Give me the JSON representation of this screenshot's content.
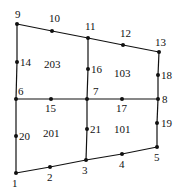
{
  "diagram": {
    "type": "finite-element-mesh",
    "colors": {
      "line": "#111111",
      "background": "#ffffff"
    },
    "nodes": [
      {
        "id": "1",
        "label": "1",
        "x": 16,
        "y": 173,
        "lx": 12,
        "ly": 187
      },
      {
        "id": "2",
        "label": "2",
        "x": 50,
        "y": 167,
        "lx": 47,
        "ly": 181
      },
      {
        "id": "3",
        "label": "3",
        "x": 86,
        "y": 160,
        "lx": 82,
        "ly": 174
      },
      {
        "id": "4",
        "label": "4",
        "x": 122,
        "y": 154,
        "lx": 119,
        "ly": 168
      },
      {
        "id": "5",
        "label": "5",
        "x": 157,
        "y": 147,
        "lx": 154,
        "ly": 161
      },
      {
        "id": "6",
        "label": "6",
        "x": 16,
        "y": 99,
        "lx": 18,
        "ly": 95
      },
      {
        "id": "7",
        "label": "7",
        "x": 87,
        "y": 99,
        "lx": 93,
        "ly": 95
      },
      {
        "id": "8",
        "label": "8",
        "x": 158,
        "y": 99,
        "lx": 162,
        "ly": 103
      },
      {
        "id": "9",
        "label": "9",
        "x": 17,
        "y": 24,
        "lx": 15,
        "ly": 18
      },
      {
        "id": "10",
        "label": "10",
        "x": 52,
        "y": 31,
        "lx": 49,
        "ly": 22
      },
      {
        "id": "11",
        "label": "11",
        "x": 88,
        "y": 38,
        "lx": 85,
        "ly": 30
      },
      {
        "id": "12",
        "label": "12",
        "x": 123,
        "y": 45,
        "lx": 120,
        "ly": 37
      },
      {
        "id": "13",
        "label": "13",
        "x": 159,
        "y": 52,
        "lx": 155,
        "ly": 46
      },
      {
        "id": "14",
        "label": "14",
        "x": 17,
        "y": 62,
        "lx": 20,
        "ly": 66
      },
      {
        "id": "15",
        "label": "15",
        "x": 51,
        "y": 99,
        "lx": 45,
        "ly": 112
      },
      {
        "id": "16",
        "label": "16",
        "x": 88,
        "y": 69,
        "lx": 91,
        "ly": 73
      },
      {
        "id": "17",
        "label": "17",
        "x": 122,
        "y": 99,
        "lx": 116,
        "ly": 112
      },
      {
        "id": "18",
        "label": "18",
        "x": 158,
        "y": 75,
        "lx": 161,
        "ly": 79
      },
      {
        "id": "19",
        "label": "19",
        "x": 157,
        "y": 123,
        "lx": 161,
        "ly": 127
      },
      {
        "id": "20",
        "label": "20",
        "x": 16,
        "y": 136,
        "lx": 19,
        "ly": 140
      },
      {
        "id": "21",
        "label": "21",
        "x": 87,
        "y": 129,
        "lx": 90,
        "ly": 133
      }
    ],
    "edges": [
      [
        "1",
        "2"
      ],
      [
        "2",
        "3"
      ],
      [
        "3",
        "4"
      ],
      [
        "4",
        "5"
      ],
      [
        "6",
        "15"
      ],
      [
        "15",
        "7"
      ],
      [
        "7",
        "17"
      ],
      [
        "17",
        "8"
      ],
      [
        "9",
        "10"
      ],
      [
        "10",
        "11"
      ],
      [
        "11",
        "12"
      ],
      [
        "12",
        "13"
      ],
      [
        "1",
        "20"
      ],
      [
        "20",
        "6"
      ],
      [
        "6",
        "14"
      ],
      [
        "14",
        "9"
      ],
      [
        "3",
        "21"
      ],
      [
        "21",
        "7"
      ],
      [
        "7",
        "16"
      ],
      [
        "16",
        "11"
      ],
      [
        "5",
        "19"
      ],
      [
        "19",
        "8"
      ],
      [
        "8",
        "18"
      ],
      [
        "18",
        "13"
      ]
    ],
    "elements": [
      {
        "id": "201",
        "label": "201",
        "x": 43,
        "y": 137
      },
      {
        "id": "101",
        "label": "101",
        "x": 114,
        "y": 133
      },
      {
        "id": "203",
        "label": "203",
        "x": 44,
        "y": 68
      },
      {
        "id": "103",
        "label": "103",
        "x": 114,
        "y": 77
      }
    ]
  }
}
